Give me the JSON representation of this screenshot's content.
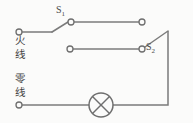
{
  "diagram": {
    "background_color": "#fbfbfa",
    "line_color": "#7b7b7b",
    "labels": {
      "switch_1": "S",
      "switch_1_sub": "1",
      "switch_2": "S",
      "switch_2_sub": "2",
      "live_wire_char_1": "火",
      "live_wire_char_2": "线",
      "neutral_wire_char_1": "零",
      "neutral_wire_char_2": "线"
    },
    "components": {
      "lamp": "lamp-symbol",
      "switch_one": "single-pole-double-throw-switch",
      "switch_two": "single-pole-double-throw-switch",
      "live_terminal": "live-wire-terminal",
      "neutral_terminal": "neutral-wire-terminal",
      "upper_traveler": "upper-traveler-wire",
      "lower_traveler": "lower-traveler-wire"
    }
  }
}
